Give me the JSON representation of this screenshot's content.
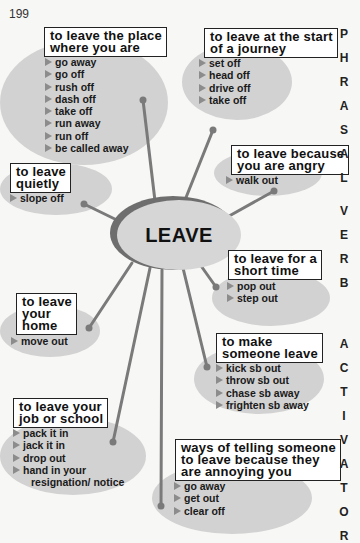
{
  "page_number": "199",
  "center": {
    "label": "LEAVE"
  },
  "side_title": [
    "P",
    "H",
    "R",
    "A",
    "S",
    "A",
    "L",
    "",
    "V",
    "E",
    "R",
    "B",
    "",
    "A",
    "C",
    "T",
    "I",
    "V",
    "A",
    "T",
    "O",
    "R"
  ],
  "groups": [
    {
      "id": "place",
      "title_lines": [
        "to leave the place",
        "where you are"
      ],
      "items": [
        "go away",
        "go off",
        "rush off",
        "dash off",
        "take off",
        "run away",
        "run off",
        "be called away"
      ]
    },
    {
      "id": "journey",
      "title_lines": [
        "to leave at the start",
        "of a journey"
      ],
      "items": [
        "set off",
        "head off",
        "drive off",
        "take off"
      ]
    },
    {
      "id": "angry",
      "title_lines": [
        "to leave because",
        "you are angry"
      ],
      "items": [
        "walk out"
      ]
    },
    {
      "id": "quietly",
      "title_lines": [
        "to leave",
        "quietly"
      ],
      "items": [
        "slope off"
      ]
    },
    {
      "id": "short-time",
      "title_lines": [
        "to leave for a",
        "short time"
      ],
      "items": [
        "pop out",
        "step out"
      ]
    },
    {
      "id": "home",
      "title_lines": [
        "to leave",
        "your",
        "home"
      ],
      "items": [
        "move out"
      ]
    },
    {
      "id": "make-leave",
      "title_lines": [
        "to make",
        "someone leave"
      ],
      "items": [
        "kick sb out",
        "throw sb out",
        "chase sb away",
        "frighten sb away"
      ]
    },
    {
      "id": "job-school",
      "title_lines": [
        "to leave your",
        "job or school"
      ],
      "items": [
        "pack it in",
        "jack it in",
        "drop out",
        "hand in your",
        "resignation/ notice"
      ]
    },
    {
      "id": "annoying",
      "title_lines": [
        "ways of telling someone",
        "to leave because they",
        "are annoying you"
      ],
      "items": [
        "go away",
        "get out",
        "clear off"
      ]
    }
  ],
  "colors": {
    "background": "#f7f7f5",
    "bubble": "#d2d2d2",
    "connector": "#7a7a7a",
    "center_ring": "#6e6e6e",
    "arrow": "#8c8c8c"
  }
}
